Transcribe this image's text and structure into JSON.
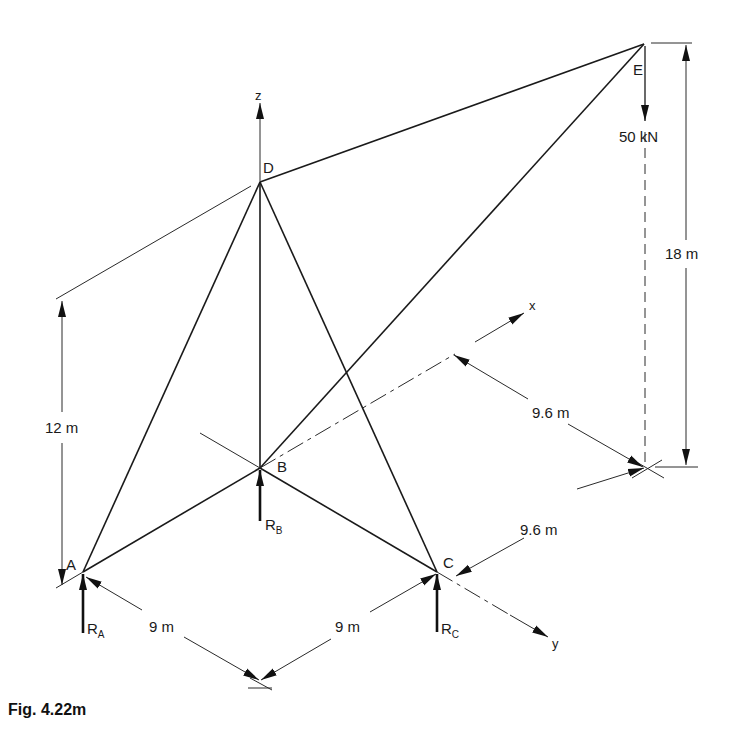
{
  "figure": {
    "caption": "Fig. 4.22m",
    "joints": {
      "A": "A",
      "B": "B",
      "C": "C",
      "D": "D",
      "E": "E"
    },
    "axes": {
      "x": "x",
      "y": "y",
      "z": "z"
    },
    "reactions": {
      "RA": {
        "main": "R",
        "sub": "A"
      },
      "RB": {
        "main": "R",
        "sub": "B"
      },
      "RC": {
        "main": "R",
        "sub": "C"
      }
    },
    "load": "50 kN",
    "dimensions": {
      "height_D": "12 m",
      "height_E": "18 m",
      "x_offset_E": "9.6 m",
      "y_offset_E": "9.6 m",
      "AB_span": "9 m",
      "BC_span": "9 m"
    },
    "colors": {
      "line": "#1a1a1a",
      "background": "#ffffff"
    }
  }
}
